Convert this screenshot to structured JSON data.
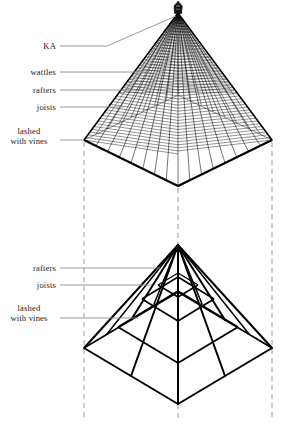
{
  "figure": {
    "ink_color": "#000000",
    "guide_color": "#8c8c8c",
    "dash_color": "#999999",
    "background": "#ffffff"
  },
  "upper_view": {
    "name": "completed wattled roof",
    "apex": {
      "x": 178,
      "y": 13
    },
    "corner_left": {
      "x": 84,
      "y": 140
    },
    "corner_right": {
      "x": 272,
      "y": 140
    },
    "corner_front": {
      "x": 178,
      "y": 186
    },
    "corner_back": {
      "x": 178,
      "y": 95
    },
    "rafter_count": 17,
    "wattle_rows": 46,
    "finial_label": "KA",
    "labels": [
      {
        "key": "ka",
        "text": "KA",
        "x": 56,
        "y": 43,
        "leader_to_x": 178,
        "leader_to_y": 17,
        "bend_x": 106,
        "bend_y": 46
      },
      {
        "key": "wattles",
        "text": "wattles",
        "x": 56,
        "y": 71,
        "leader_to_x": 148,
        "leader_to_y": 73
      },
      {
        "key": "rafters",
        "text": "rafters",
        "x": 56,
        "y": 89,
        "leader_to_x": 134,
        "leader_to_y": 90
      },
      {
        "key": "joists",
        "text": "joists",
        "x": 56,
        "y": 106,
        "leader_to_x": 122,
        "leader_to_y": 107
      },
      {
        "key": "lashed",
        "line1": "lashed",
        "line2": "with vines",
        "x": 12,
        "y": 126,
        "leader_to_x": 84,
        "leader_to_y": 140
      }
    ]
  },
  "lower_view": {
    "name": "roof frame: rafters and joists",
    "apex": {
      "x": 178,
      "y": 245
    },
    "corner_left": {
      "x": 84,
      "y": 348
    },
    "corner_right": {
      "x": 272,
      "y": 348
    },
    "corner_front": {
      "x": 178,
      "y": 404
    },
    "corner_back": {
      "x": 178,
      "y": 292
    },
    "joist_ring_count": 4,
    "rafter_count": 8,
    "labels": [
      {
        "key": "rafters",
        "text": "rafters",
        "x": 56,
        "y": 265,
        "leader_to_x": 158,
        "leader_to_y": 268
      },
      {
        "key": "joists",
        "text": "joists",
        "x": 56,
        "y": 283,
        "leader_to_x": 150,
        "leader_to_y": 285
      },
      {
        "key": "lashed",
        "line1": "lashed",
        "line2": "with vines",
        "x": 12,
        "y": 303,
        "leader_to_x": 136,
        "leader_to_y": 318
      }
    ]
  },
  "projection_lines": [
    {
      "name": "left-projection",
      "x": 84,
      "y1": 142,
      "y2": 420
    },
    {
      "name": "center-projection",
      "x": 178,
      "y1": 188,
      "y2": 420
    },
    {
      "name": "right-projection",
      "x": 272,
      "y1": 142,
      "y2": 420
    }
  ]
}
